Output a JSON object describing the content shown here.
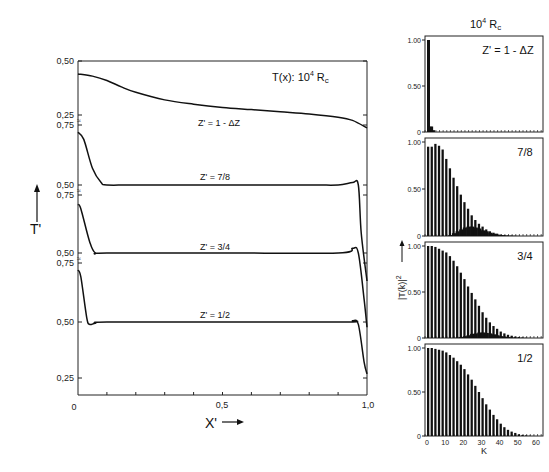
{
  "chart_data": [
    {
      "type": "line",
      "title": "T(x): 10⁴ Rc",
      "xlabel": "X'",
      "ylabel": "T'",
      "xlim": [
        0,
        1.0
      ],
      "x_tick_labels": [
        "0",
        "0,5",
        "1,0"
      ],
      "grid": false,
      "stacked_offsets": true,
      "series": [
        {
          "name": "Z' = 1 - ΔZ",
          "y_axis_ticks": [
            "0.50",
            "0.25"
          ],
          "x": [
            0,
            0.05,
            0.1,
            0.15,
            0.2,
            0.3,
            0.4,
            0.5,
            0.6,
            0.7,
            0.8,
            0.9,
            0.95,
            1.0
          ],
          "y": [
            0.44,
            0.43,
            0.41,
            0.38,
            0.355,
            0.32,
            0.3,
            0.285,
            0.275,
            0.265,
            0.255,
            0.24,
            0.225,
            0.19
          ]
        },
        {
          "name": "Z' = 7/8",
          "y_axis_ticks": [
            "0.75",
            "0.50"
          ],
          "x": [
            0,
            0.02,
            0.05,
            0.08,
            0.1,
            0.2,
            0.5,
            0.8,
            0.9,
            0.95,
            0.97,
            0.98,
            1.0
          ],
          "y": [
            0.72,
            0.69,
            0.57,
            0.51,
            0.5,
            0.5,
            0.5,
            0.5,
            0.5,
            0.51,
            0.5,
            0.3,
            0.1
          ]
        },
        {
          "name": "Z' = 3/4",
          "y_axis_ticks": [
            "0.75",
            "0.50"
          ],
          "x": [
            0,
            0.01,
            0.04,
            0.06,
            0.1,
            0.5,
            0.9,
            0.95,
            0.97,
            0.99,
            1.0
          ],
          "y": [
            0.71,
            0.69,
            0.55,
            0.5,
            0.5,
            0.5,
            0.5,
            0.52,
            0.5,
            0.3,
            0.18
          ]
        },
        {
          "name": "Z' = 1/2",
          "y_axis_ticks": [
            "0.75",
            "0.50",
            "0.25"
          ],
          "x": [
            0,
            0.01,
            0.03,
            0.04,
            0.06,
            0.1,
            0.5,
            0.93,
            0.95,
            0.97,
            0.99,
            1.0
          ],
          "y": [
            0.72,
            0.69,
            0.52,
            0.49,
            0.495,
            0.5,
            0.5,
            0.5,
            0.505,
            0.49,
            0.33,
            0.28
          ]
        }
      ]
    },
    {
      "type": "bar",
      "title": "10⁴ Rc",
      "xlabel": "K",
      "ylabel": "|T(k)|²",
      "xlim": [
        0,
        65
      ],
      "ylim": [
        0,
        1.0
      ],
      "x_tick_labels": [
        "0",
        "10",
        "20",
        "30",
        "40",
        "50",
        "60"
      ],
      "y_tick_labels": [
        "0",
        "0.50",
        "1.00"
      ],
      "panels": [
        {
          "name": "Z' = 1 - ΔZ",
          "k": [
            0,
            1,
            2,
            3
          ],
          "values": [
            1.0,
            0.06,
            0.06,
            0.02
          ],
          "secondary": []
        },
        {
          "name": "7/8",
          "k": [
            0,
            2,
            4,
            6,
            8,
            10,
            12,
            14,
            16,
            18,
            20,
            22,
            24,
            26,
            28,
            30,
            32,
            34,
            36,
            38,
            40,
            42,
            44,
            46,
            48,
            50
          ],
          "values": [
            0.95,
            0.95,
            0.98,
            0.96,
            0.92,
            0.82,
            0.72,
            0.62,
            0.53,
            0.44,
            0.36,
            0.29,
            0.22,
            0.17,
            0.13,
            0.1,
            0.07,
            0.05,
            0.035,
            0.025,
            0.015,
            0.01,
            0.006,
            0.004,
            0.002,
            0.001
          ],
          "secondary": [
            0,
            0,
            0,
            0,
            0,
            0,
            0.01,
            0.03,
            0.05,
            0.07,
            0.09,
            0.1,
            0.1,
            0.09,
            0.08,
            0.06,
            0.05,
            0.035,
            0.025,
            0.015,
            0.01,
            0.005,
            0.003,
            0.002,
            0.001,
            0
          ]
        },
        {
          "name": "3/4",
          "k": [
            0,
            2,
            4,
            6,
            8,
            10,
            12,
            14,
            16,
            18,
            20,
            22,
            24,
            26,
            28,
            30,
            32,
            34,
            36,
            38,
            40,
            42,
            44,
            46,
            48,
            50,
            52,
            54,
            56
          ],
          "values": [
            1.0,
            1.0,
            0.99,
            0.97,
            0.95,
            0.93,
            0.89,
            0.84,
            0.78,
            0.71,
            0.64,
            0.56,
            0.49,
            0.42,
            0.35,
            0.28,
            0.22,
            0.17,
            0.13,
            0.1,
            0.07,
            0.05,
            0.035,
            0.025,
            0.015,
            0.01,
            0.006,
            0.003,
            0.001
          ],
          "secondary": [
            0,
            0,
            0,
            0,
            0,
            0,
            0,
            0,
            0.005,
            0.01,
            0.02,
            0.03,
            0.045,
            0.05,
            0.06,
            0.06,
            0.055,
            0.05,
            0.04,
            0.03,
            0.02,
            0.015,
            0.01,
            0.005,
            0.003,
            0.002,
            0.001,
            0,
            0
          ]
        },
        {
          "name": "1/2",
          "k": [
            0,
            2,
            4,
            6,
            8,
            10,
            12,
            14,
            16,
            18,
            20,
            22,
            24,
            26,
            28,
            30,
            32,
            34,
            36,
            38,
            40,
            42,
            44,
            46,
            48,
            50,
            52,
            54,
            56,
            58
          ],
          "values": [
            1.0,
            1.0,
            0.99,
            0.98,
            0.97,
            0.95,
            0.92,
            0.89,
            0.85,
            0.81,
            0.76,
            0.7,
            0.64,
            0.57,
            0.5,
            0.43,
            0.36,
            0.3,
            0.24,
            0.19,
            0.14,
            0.1,
            0.07,
            0.05,
            0.035,
            0.02,
            0.012,
            0.007,
            0.003,
            0.001
          ],
          "secondary": []
        }
      ]
    }
  ],
  "left_panel": {
    "title": "T(x): 10",
    "title_sup": "4",
    "title_tail": " R",
    "title_sub": "c",
    "y_axis_label": "T'",
    "x_axis_label": "X'",
    "x_ticks": [
      "0",
      "0,5",
      "1,0"
    ],
    "y_ticks": [
      "0,50",
      "0,25",
      "0,75",
      "0,50",
      "0,75",
      "0,50",
      "0,75",
      "0,50",
      "0,25"
    ],
    "curve_labels": [
      "Z' = 1 - ΔZ",
      "Z' = 7/8",
      "Z' = 3/4",
      "Z' = 1/2"
    ],
    "break_mark": "≈"
  },
  "right_panel": {
    "title": "10",
    "title_sup": "4",
    "title_tail": " R",
    "title_sub": "c",
    "y_axis_label": "|T(k)|",
    "y_axis_sup": "2",
    "x_axis_label": "K",
    "x_ticks": [
      "0",
      "10",
      "20",
      "30",
      "40",
      "50",
      "60"
    ],
    "y_ticks": [
      "0",
      "0.50",
      "1.00"
    ],
    "panel_labels": [
      "Z' = 1 - ΔZ",
      "7/8",
      "3/4",
      "1/2"
    ]
  },
  "colors": {
    "ink": "#111111",
    "background": "#ffffff"
  }
}
